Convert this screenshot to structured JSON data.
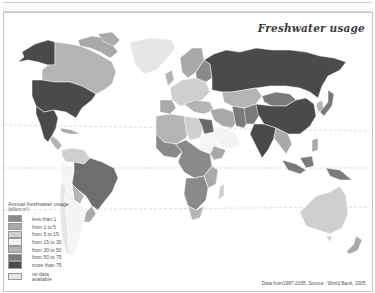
{
  "map": {
    "title": "Freshwater usage",
    "source": "Data from1987-2005. Source : World Bank, 2005.",
    "projection": "world, equator and tropic lines shown as dashed lines",
    "legend": {
      "title": "Annual freshwater usage",
      "unit": "(billion m³)",
      "items": [
        {
          "label": "less than 1",
          "color": "#8a8a8a"
        },
        {
          "label": "from 1 to 5",
          "color": "#a9a9a9"
        },
        {
          "label": "from 5 to 15",
          "color": "#cfcfcf"
        },
        {
          "label": "from 15 to 30",
          "color": "#f4f4f4"
        },
        {
          "label": "from 30 to 50",
          "color": "#b4b4b4"
        },
        {
          "label": "from 50 to 75",
          "color": "#7a7a7a"
        },
        {
          "label": "more than 75",
          "color": "#4a4a4a"
        }
      ],
      "no_data": {
        "label": "no data available",
        "color": "#e6e6e6"
      }
    },
    "regions": [
      {
        "name": "USA",
        "class": "more than 75"
      },
      {
        "name": "Alaska",
        "class": "more than 75"
      },
      {
        "name": "Canada",
        "class": "from 30 to 50"
      },
      {
        "name": "Mexico",
        "class": "more than 75"
      },
      {
        "name": "Greenland",
        "class": "no data available"
      },
      {
        "name": "Brazil",
        "class": "from 50 to 75"
      },
      {
        "name": "Argentina/Chile",
        "class": "from 15 to 30"
      },
      {
        "name": "Russia",
        "class": "more than 75"
      },
      {
        "name": "China",
        "class": "more than 75"
      },
      {
        "name": "India",
        "class": "more than 75"
      },
      {
        "name": "Kazakhstan",
        "class": "from 30 to 50"
      },
      {
        "name": "Mongolia",
        "class": "from 50 to 75"
      },
      {
        "name": "Australia",
        "class": "from 5 to 15"
      },
      {
        "name": "Africa (central)",
        "class": "less than 1"
      },
      {
        "name": "Sahara / North Africa",
        "class": "from 5 to 15"
      },
      {
        "name": "Europe",
        "class": "from 5 to 15"
      },
      {
        "name": "Indonesia",
        "class": "from 50 to 75"
      }
    ]
  }
}
